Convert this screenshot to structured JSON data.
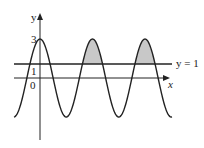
{
  "diagram": {
    "axis_labels": {
      "x": "x",
      "y": "y"
    },
    "tick_labels": {
      "three": "3",
      "one": "1",
      "zero": "0"
    },
    "line_label": "y = 1",
    "curve": "y = 3cos(x)",
    "shaded": "regions where curve exceeds y = 1 (2nd and 3rd peaks)",
    "colors": {
      "shade": "#c8c8c8",
      "stroke": "#222222"
    }
  }
}
